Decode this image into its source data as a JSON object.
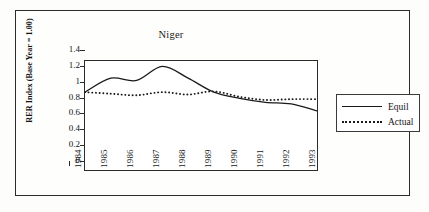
{
  "figure": {
    "title": "Niger",
    "y_axis_title": "RER Index (Base Year = 1.00)"
  },
  "legend": {
    "entries": [
      {
        "label": "Equil",
        "style": "solid"
      },
      {
        "label": "Actual",
        "style": "dotted"
      }
    ]
  },
  "chart_data": {
    "type": "line",
    "title": "Niger",
    "xlabel": "",
    "ylabel": "RER Index (Base Year = 1.00)",
    "x": [
      1984,
      1985,
      1986,
      1987,
      1988,
      1989,
      1990,
      1991,
      1992,
      1993
    ],
    "xtick_labels": [
      "1984",
      "1985",
      "1986",
      "1987",
      "1988",
      "1989",
      "1990",
      "1991",
      "1992",
      "1993"
    ],
    "ytick_labels": [
      "0",
      "0.2",
      "0.4",
      "0.6",
      "0.8",
      "1",
      "1.2",
      "1.4"
    ],
    "yticks": [
      0,
      0.2,
      0.4,
      0.6,
      0.8,
      1.0,
      1.2,
      1.4
    ],
    "ylim": [
      0,
      1.4
    ],
    "xlim": [
      1984,
      1993
    ],
    "grid": false,
    "legend_position": "right-outside",
    "series": [
      {
        "name": "Equil",
        "style": "solid",
        "color": "#1a1a1a",
        "values": [
          1.0,
          1.18,
          1.15,
          1.33,
          1.18,
          1.0,
          0.92,
          0.87,
          0.85,
          0.76
        ]
      },
      {
        "name": "Actual",
        "style": "dotted",
        "color": "#1a1a1a",
        "values": [
          1.0,
          0.98,
          0.96,
          1.0,
          0.97,
          1.01,
          0.94,
          0.9,
          0.91,
          0.91
        ]
      }
    ]
  }
}
